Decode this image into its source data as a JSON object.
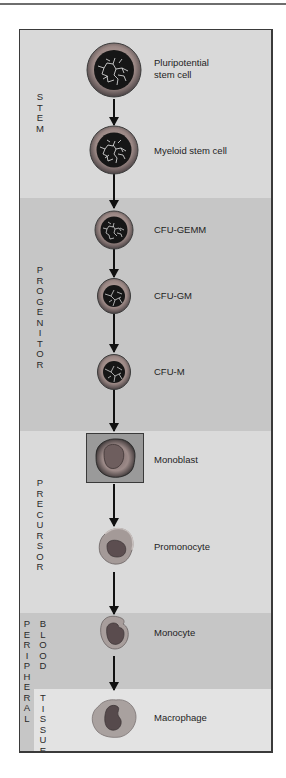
{
  "diagram": {
    "stages": [
      {
        "id": "stem",
        "label": "STEM",
        "letters": [
          "S",
          "T",
          "E",
          "M"
        ]
      },
      {
        "id": "progenitor",
        "label": "PROGENITOR",
        "letters": [
          "P",
          "R",
          "O",
          "G",
          "E",
          "N",
          "I",
          "T",
          "O",
          "R"
        ]
      },
      {
        "id": "precursor",
        "label": "PRECURSOR",
        "letters": [
          "P",
          "R",
          "E",
          "C",
          "U",
          "R",
          "S",
          "O",
          "R"
        ]
      },
      {
        "id": "blood",
        "label": "BLOOD",
        "letters": [
          "B",
          "L",
          "O",
          "O",
          "D"
        ]
      },
      {
        "id": "tissue",
        "label": "TISSUE",
        "letters": [
          "T",
          "I",
          "S",
          "S",
          "U",
          "E"
        ]
      },
      {
        "id": "peripheral",
        "label": "PERIPHERAL",
        "letters": [
          "P",
          "E",
          "R",
          "I",
          "P",
          "H",
          "E",
          "R",
          "A",
          "L"
        ]
      }
    ],
    "cells": [
      {
        "name": "Pluripotential stem cell",
        "label": "Pluripotential\nstem cell",
        "stage": "stem"
      },
      {
        "name": "Myeloid stem cell",
        "label": "Myeloid stem cell",
        "stage": "stem"
      },
      {
        "name": "CFU-GEMM",
        "label": "CFU-GEMM",
        "stage": "progenitor"
      },
      {
        "name": "CFU-GM",
        "label": "CFU-GM",
        "stage": "progenitor"
      },
      {
        "name": "CFU-M",
        "label": "CFU-M",
        "stage": "progenitor"
      },
      {
        "name": "Monoblast",
        "label": "Monoblast",
        "stage": "precursor"
      },
      {
        "name": "Promonocyte",
        "label": "Promonocyte",
        "stage": "precursor"
      },
      {
        "name": "Monocyte",
        "label": "Monocyte",
        "stage": "blood"
      },
      {
        "name": "Macrophage",
        "label": "Macrophage",
        "stage": "tissue"
      }
    ],
    "edges": [
      [
        "Pluripotential stem cell",
        "Myeloid stem cell"
      ],
      [
        "Myeloid stem cell",
        "CFU-GEMM"
      ],
      [
        "CFU-GEMM",
        "CFU-GM"
      ],
      [
        "CFU-GM",
        "CFU-M"
      ],
      [
        "CFU-M",
        "Monoblast"
      ],
      [
        "Monoblast",
        "Promonocyte"
      ],
      [
        "Promonocyte",
        "Monocyte"
      ],
      [
        "Monocyte",
        "Macrophage"
      ]
    ],
    "colors": {
      "band_light": "#d9d9d9",
      "band_dark": "#c6c6c6",
      "band_tissue": "#e3e3e3",
      "cell_rim": "#8a8a8a",
      "nucleus": "#1a1a1a",
      "arrow": "#111111"
    }
  }
}
